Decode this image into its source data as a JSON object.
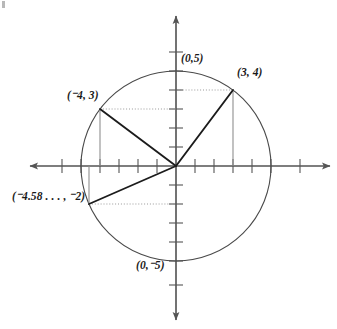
{
  "figure": {
    "kind": "coordinate-plane-circle-diagram",
    "axes": {
      "origin_px": [
        176,
        166
      ],
      "unit_px": 19,
      "x_axis_name": "x-axis",
      "y_axis_name": "y-axis",
      "x_range_units": [
        -8.2,
        8.2
      ],
      "y_range_units": [
        -8.0,
        8.0
      ],
      "tick_spacing_units": 1,
      "arrowheads": [
        "left",
        "right",
        "up",
        "down"
      ]
    },
    "circle": {
      "center_units": [
        0,
        0
      ],
      "radius_units": 5,
      "radius_px": 95,
      "stroke": "#4a4a4a"
    },
    "points": [
      {
        "name": "point-0-5",
        "label": "(0,5)",
        "coords_units": [
          0,
          5
        ],
        "label_px": [
          181,
          57
        ],
        "has_radius_segment": false,
        "has_drop_lines": false
      },
      {
        "name": "point-3-4",
        "label": "(3, 4)",
        "coords_units": [
          3,
          4
        ],
        "label_px": [
          238,
          71
        ],
        "has_radius_segment": true,
        "has_drop_lines": true
      },
      {
        "name": "point-neg4-3",
        "label": "(⁻4, 3)",
        "coords_units": [
          -4,
          3
        ],
        "label_px": [
          68,
          93
        ],
        "has_radius_segment": true,
        "has_drop_lines": true
      },
      {
        "name": "point-neg4-58-neg2",
        "label": "(⁻4.58 . . . , ⁻2)",
        "coords_units": [
          -4.58,
          -2
        ],
        "label_px": [
          13,
          193
        ],
        "has_radius_segment": true,
        "has_drop_lines": true
      },
      {
        "name": "point-0-neg5",
        "label": "(0,⁻5)",
        "coords_units": [
          0,
          -5
        ],
        "label_px": [
          137,
          263
        ],
        "has_radius_segment": false,
        "has_drop_lines": false
      }
    ],
    "colors": {
      "axis": "#555555",
      "circle": "#4a4a4a",
      "radius_segment": "#1c1c1c",
      "drop_line": "#8f8f8f",
      "dotted_line": "#9a9a9a",
      "label_text": "#1a1a1a",
      "background": "#ffffff"
    }
  }
}
